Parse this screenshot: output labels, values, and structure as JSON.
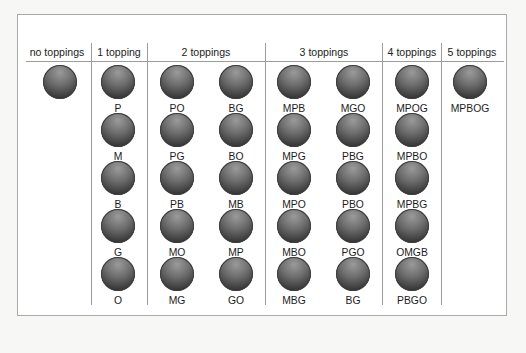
{
  "headers": [
    "no toppings",
    "1 topping",
    "2 toppings",
    "3 toppings",
    "4 toppings",
    "5 toppings"
  ],
  "columns": [
    {
      "header_index": 0,
      "x": 60,
      "items": [
        ""
      ]
    },
    {
      "header_index": 1,
      "x": 118,
      "items": [
        "P",
        "M",
        "B",
        "G",
        "O"
      ]
    },
    {
      "header_index": 2,
      "x": 177,
      "items": [
        "PO",
        "PG",
        "PB",
        "MO",
        "MG"
      ]
    },
    {
      "header_index": 2,
      "x": 236,
      "items": [
        "BG",
        "BO",
        "MB",
        "MP",
        "GO"
      ]
    },
    {
      "header_index": 3,
      "x": 294,
      "items": [
        "MPB",
        "MPG",
        "MPO",
        "MBO",
        "MBG"
      ]
    },
    {
      "header_index": 3,
      "x": 353,
      "items": [
        "MGO",
        "PBG",
        "PBO",
        "PGO",
        "BG"
      ]
    },
    {
      "header_index": 4,
      "x": 412,
      "items": [
        "MPOG",
        "MPBO",
        "MPBG",
        "OMGB",
        "PBGO"
      ]
    },
    {
      "header_index": 5,
      "x": 470,
      "items": [
        "MPBOG"
      ]
    }
  ],
  "colors": {
    "ball_light": "#9a9a9a",
    "ball_dark": "#222222",
    "line": "#9c9c9c"
  }
}
